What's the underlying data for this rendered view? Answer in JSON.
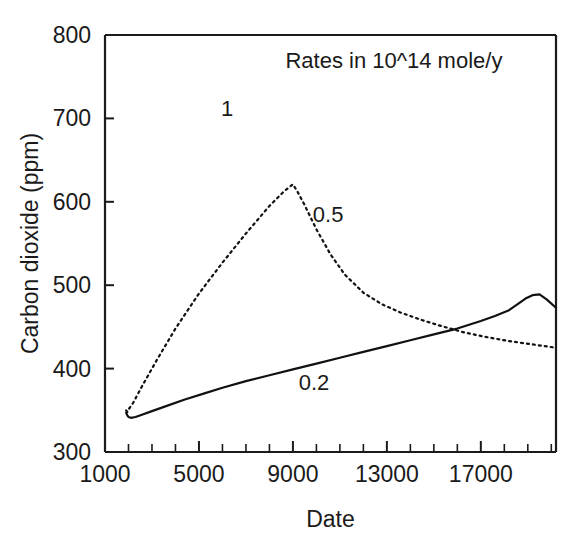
{
  "chart_data": {
    "type": "line",
    "title": "",
    "annotation_note": "Rates in 10^14 mole/y",
    "xlabel": "Date",
    "ylabel": "Carbon dioxide (ppm)",
    "xlim": [
      1000,
      20200
    ],
    "ylim": [
      300,
      800
    ],
    "xticks": [
      1000,
      5000,
      9000,
      13000,
      17000
    ],
    "xtick_labels": [
      "1000",
      "5000",
      "9000",
      "13000",
      "17000"
    ],
    "xtick_minor_step": 1000,
    "yticks": [
      300,
      400,
      500,
      600,
      700,
      800
    ],
    "ytick_labels": [
      "300",
      "400",
      "500",
      "600",
      "700",
      "800"
    ],
    "grid": false,
    "legend": "inline-labels",
    "series": [
      {
        "name": "0.2",
        "label": "0.2",
        "style": "solid",
        "label_x": 9900,
        "label_y": 384,
        "x": [
          1900,
          1950,
          2000,
          2100,
          2300,
          2600,
          3000,
          3600,
          4400,
          5200,
          6000,
          7000,
          8000,
          9000,
          10000,
          11000,
          12000,
          13000,
          14000,
          15000,
          16000,
          17000,
          17600,
          18200,
          18600,
          18900,
          19200,
          19500,
          19800,
          20200
        ],
        "y": [
          347,
          344,
          342,
          341,
          342,
          345,
          349,
          355,
          363,
          370,
          377,
          385,
          392,
          399,
          406,
          413,
          420,
          427,
          434,
          441,
          448,
          457,
          463,
          470,
          478,
          484,
          488,
          489,
          483,
          473
        ]
      },
      {
        "name": "0.5",
        "label": "0.5",
        "style": "dotted",
        "label_x": 10500,
        "label_y": 585,
        "x": [
          1900,
          1950,
          2000,
          2200,
          2600,
          3200,
          4000,
          5000,
          6000,
          7000,
          8000,
          8600,
          9000,
          9200,
          9500,
          10000,
          10600,
          11200,
          12000,
          12800,
          13600,
          14400,
          15200,
          16200,
          17200,
          18200,
          19200,
          20200
        ],
        "y": [
          350,
          348,
          351,
          359,
          380,
          410,
          448,
          490,
          527,
          562,
          595,
          612,
          621,
          612,
          596,
          567,
          537,
          513,
          491,
          477,
          467,
          459,
          452,
          444,
          438,
          433,
          429,
          425
        ]
      },
      {
        "name": "1",
        "label": "1",
        "style": "label-only",
        "label_x": 6200,
        "label_y": 712
      }
    ],
    "note_x": 13300,
    "note_y": 761
  }
}
